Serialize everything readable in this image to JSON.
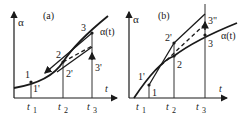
{
  "panels": [
    {
      "id": "a",
      "label": "(a)",
      "y_axis_label": "α",
      "x_axis_label": "t",
      "curve_label": "α(t)",
      "ticks": [
        "t",
        "t",
        "t"
      ],
      "tick_subs": [
        "1",
        "2",
        "3"
      ],
      "points": [
        "1",
        "1'",
        "2",
        "2'",
        "3",
        "3'"
      ]
    },
    {
      "id": "b",
      "label": "(b)",
      "y_axis_label": "α",
      "x_axis_label": "t",
      "curve_label": "α(t)",
      "ticks": [
        "t",
        "t",
        "t"
      ],
      "tick_subs": [
        "1",
        "2",
        "3"
      ],
      "points": [
        "1",
        "1'",
        "2",
        "2'",
        "3",
        "3\""
      ]
    }
  ],
  "colors": {
    "ink": "#1a1a1a",
    "background": "#ffffff"
  }
}
